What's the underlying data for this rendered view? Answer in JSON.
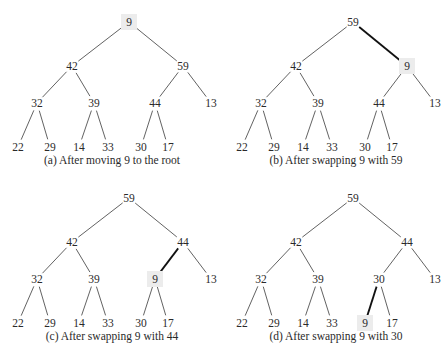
{
  "colors": {
    "edge": "#3a3a3a",
    "bold_edge": "#111111",
    "highlight": "#ececec",
    "text": "#2a2a2a"
  },
  "layout": {
    "positions": [
      [
        129,
        22
      ],
      [
        72,
        66
      ],
      [
        183,
        66
      ],
      [
        37,
        103
      ],
      [
        94,
        103
      ],
      [
        155,
        103
      ],
      [
        211,
        103
      ],
      [
        18,
        147
      ],
      [
        50,
        147
      ],
      [
        79,
        147
      ],
      [
        108,
        147
      ],
      [
        141,
        147
      ],
      [
        168,
        147
      ]
    ],
    "edges": [
      [
        0,
        1
      ],
      [
        0,
        2
      ],
      [
        1,
        3
      ],
      [
        1,
        4
      ],
      [
        2,
        5
      ],
      [
        2,
        6
      ],
      [
        3,
        7
      ],
      [
        3,
        8
      ],
      [
        4,
        9
      ],
      [
        4,
        10
      ],
      [
        5,
        11
      ],
      [
        5,
        12
      ]
    ]
  },
  "panels": [
    {
      "id": "a",
      "caption": "(a) After moving 9 to the root",
      "values": [
        "9",
        "42",
        "59",
        "32",
        "39",
        "44",
        "13",
        "22",
        "29",
        "14",
        "33",
        "30",
        "17"
      ],
      "highlight_node": 0,
      "bold_edge": null
    },
    {
      "id": "b",
      "caption": "(b) After swapping 9 with 59",
      "values": [
        "59",
        "42",
        "9",
        "32",
        "39",
        "44",
        "13",
        "22",
        "29",
        "14",
        "33",
        "30",
        "17"
      ],
      "highlight_node": 2,
      "bold_edge": [
        0,
        2
      ]
    },
    {
      "id": "c",
      "caption": "(c) After swapping 9 with 44",
      "values": [
        "59",
        "42",
        "44",
        "32",
        "39",
        "9",
        "13",
        "22",
        "29",
        "14",
        "33",
        "30",
        "17"
      ],
      "highlight_node": 5,
      "bold_edge": [
        2,
        5
      ]
    },
    {
      "id": "d",
      "caption": "(d) After swapping 9 with 30",
      "values": [
        "59",
        "42",
        "44",
        "32",
        "39",
        "30",
        "13",
        "22",
        "29",
        "14",
        "33",
        "9",
        "17"
      ],
      "highlight_node": 11,
      "bold_edge": [
        5,
        11
      ]
    }
  ]
}
